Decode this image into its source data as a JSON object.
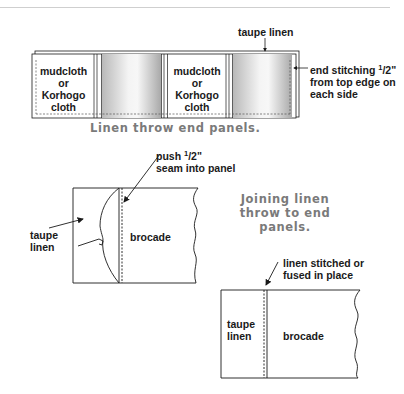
{
  "figure1": {
    "top_label": "taupe linen",
    "panels": [
      {
        "type": "mudcloth",
        "lines": [
          "mudcloth",
          "or",
          "Korhogo",
          "cloth"
        ]
      },
      {
        "type": "gradient"
      },
      {
        "type": "mudcloth",
        "lines": [
          "mudcloth",
          "or",
          "Korhogo",
          "cloth"
        ]
      },
      {
        "type": "gradient"
      }
    ],
    "stitch_label": {
      "line1_prefix": "end stitching ",
      "line1_frac_num": "1",
      "line1_frac_rest": "/2\"",
      "line2": "from top edge on",
      "line3": "each side"
    },
    "caption": "Linen throw end panels."
  },
  "figure2": {
    "seam_label": {
      "line1_prefix": "push ",
      "line1_frac_num": "1",
      "line1_frac_rest": "/2\"",
      "line2": "seam into panel"
    },
    "left_label": [
      "taupe",
      "linen"
    ],
    "right_label": "brocade",
    "caption": [
      "Joining linen",
      "throw to end",
      "panels."
    ]
  },
  "figure3": {
    "top_label": [
      "linen stitched or",
      "fused in place"
    ],
    "left_label": [
      "taupe",
      "linen"
    ],
    "right_label": "brocade"
  },
  "colors": {
    "line": "#1a1a1a",
    "caption": "#7a7a7a",
    "rule": "#cccccc"
  }
}
